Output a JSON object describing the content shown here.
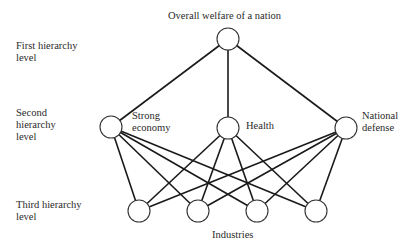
{
  "title": "Overall welfare of a nation",
  "levels": [
    {
      "label": "First hierarchy\nlevel"
    },
    {
      "label": "Second\nhierarchy\nlevel"
    },
    {
      "label": "Third hierarchy\nlevel"
    }
  ],
  "second_level_nodes": [
    {
      "label": "Strong\neconomy"
    },
    {
      "label": "Health"
    },
    {
      "label": "National\ndefense"
    }
  ],
  "third_level_caption": "Industries",
  "colors": {
    "line": "#1a1a1a",
    "text": "#2a2a2a",
    "background": "#ffffff"
  },
  "graph": {
    "top": {
      "x": 228,
      "y": 39
    },
    "second": [
      {
        "x": 111,
        "y": 127
      },
      {
        "x": 228,
        "y": 128
      },
      {
        "x": 346,
        "y": 128
      }
    ],
    "third": [
      {
        "x": 139,
        "y": 211
      },
      {
        "x": 198,
        "y": 211
      },
      {
        "x": 257,
        "y": 211
      },
      {
        "x": 316,
        "y": 211
      }
    ],
    "radius": 11
  }
}
